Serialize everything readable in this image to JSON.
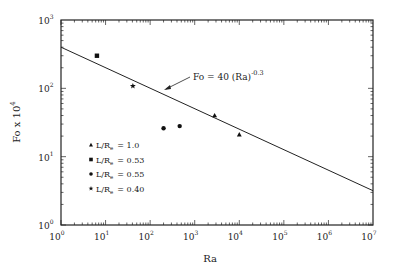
{
  "chart_data": {
    "type": "scatter",
    "title": "",
    "xlabel": "Ra",
    "ylabel": "Fo x 10^4",
    "xscale": "log",
    "yscale": "log",
    "xlim": [
      1,
      10000000
    ],
    "ylim": [
      1,
      1000
    ],
    "x_ticks": [
      {
        "base": "10",
        "exp": "0"
      },
      {
        "base": "10",
        "exp": "1"
      },
      {
        "base": "10",
        "exp": "2"
      },
      {
        "base": "10",
        "exp": "3"
      },
      {
        "base": "10",
        "exp": "4"
      },
      {
        "base": "10",
        "exp": "5"
      },
      {
        "base": "10",
        "exp": "6"
      },
      {
        "base": "10",
        "exp": "7"
      }
    ],
    "y_ticks": [
      {
        "base": "10",
        "exp": "0"
      },
      {
        "base": "10",
        "exp": "1"
      },
      {
        "base": "10",
        "exp": "2"
      },
      {
        "base": "10",
        "exp": "3"
      }
    ],
    "grid": false,
    "legend_position": "lower-left inside",
    "series": [
      {
        "name": "L/Rₑ = 1.0",
        "label_main": "L/R",
        "label_sub": "e",
        "label_value": "= 1.0",
        "marker": "triangle",
        "points": [
          {
            "x": 2800,
            "y": 40
          },
          {
            "x": 10000,
            "y": 21
          }
        ]
      },
      {
        "name": "L/Rₑ = 0.53",
        "label_main": "L/R",
        "label_sub": "e",
        "label_value": "= 0.53",
        "marker": "square",
        "points": [
          {
            "x": 6.4,
            "y": 300
          }
        ]
      },
      {
        "name": "L/Rₑ = 0.55",
        "label_main": "L/R",
        "label_sub": "e",
        "label_value": "= 0.55",
        "marker": "circle",
        "points": [
          {
            "x": 200,
            "y": 26
          },
          {
            "x": 460,
            "y": 28
          }
        ]
      },
      {
        "name": "L/Rₑ = 0.40",
        "label_main": "L/R",
        "label_sub": "e",
        "label_value": "= 0.40",
        "marker": "star",
        "points": [
          {
            "x": 41,
            "y": 108
          }
        ]
      }
    ],
    "fit_line": {
      "equation": "Fo = 40 (Ra)^-0.3",
      "coef": 400,
      "exponent": -0.3,
      "note": "y-axis is Fo x 10^4, so plotted value = 400 * Ra^-0.3"
    },
    "annotations": [
      {
        "text_main": "Fo  =  40  (Ra)",
        "text_sup": "-0.3",
        "arrow_to": {
          "x": 150,
          "y": 24
        }
      }
    ]
  },
  "labels": {
    "xlabel": "Ra",
    "ylabel_main": "Fo  x  10",
    "ylabel_sup": "4"
  }
}
